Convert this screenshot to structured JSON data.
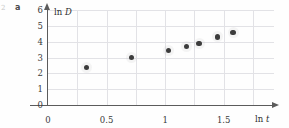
{
  "figure": {
    "panel_label": "a",
    "edge_mark": "2"
  },
  "chart_data": {
    "type": "scatter",
    "title": "",
    "xlabel": "ln t",
    "ylabel": "ln D",
    "xlim": [
      0,
      1.93
    ],
    "ylim": [
      0,
      6
    ],
    "grid": true,
    "legend": null,
    "xticks": [
      "0",
      "0.5",
      "1",
      "1.5"
    ],
    "xtick_values": [
      0,
      0.5,
      1,
      1.5
    ],
    "yticks": [
      "0",
      "1",
      "2",
      "3",
      "4",
      "5",
      "6"
    ],
    "ytick_values": [
      0,
      1,
      2,
      3,
      4,
      5,
      6
    ],
    "x": [
      0.33,
      0.71,
      1.03,
      1.18,
      1.29,
      1.45,
      1.58
    ],
    "y": [
      2.35,
      3.0,
      3.45,
      3.7,
      3.9,
      4.3,
      4.6
    ],
    "series": [
      {
        "name": "ln D vs ln t",
        "marker": "circle",
        "color": "#3c3c3c",
        "points": [
          {
            "x": 0.33,
            "y": 2.35
          },
          {
            "x": 0.71,
            "y": 3.0
          },
          {
            "x": 1.03,
            "y": 3.45
          },
          {
            "x": 1.18,
            "y": 3.7
          },
          {
            "x": 1.29,
            "y": 3.9
          },
          {
            "x": 1.45,
            "y": 4.3
          },
          {
            "x": 1.58,
            "y": 4.6
          }
        ]
      }
    ]
  },
  "colors": {
    "marker": "#3c3c3c",
    "grid": "#e2e2e6",
    "axis": "#5b5b5b",
    "text": "#3a3a3a",
    "background": "#fefefe"
  }
}
